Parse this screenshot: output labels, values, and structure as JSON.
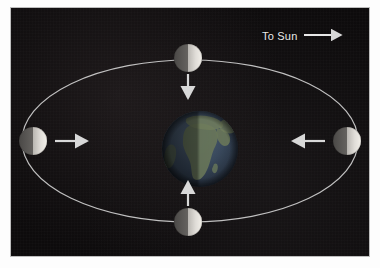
{
  "figure": {
    "background_color": "#0d0b0c",
    "matte_color": "#fdfdfd",
    "border_color": "#bdbdbd"
  },
  "annotations": {
    "to_sun_label": "To Sun",
    "to_sun_arrow": "arrow-right-icon"
  },
  "earth": {
    "name": "Earth",
    "center": {
      "x": 189,
      "y": 141
    },
    "radius": 38,
    "lit_side": "right",
    "ocean_color": "#3a4a5e",
    "land_color": "#5d6b55",
    "shadow_color": "#1b1f26"
  },
  "orbit": {
    "label": "Moon orbit",
    "center": {
      "x": 179,
      "y": 133
    },
    "radius_x": 168,
    "radius_y": 81,
    "stroke_color": "#cfcfcf",
    "stroke_width": 1.2
  },
  "moons": [
    {
      "id": "moon-top",
      "position_label": "first-quarter",
      "center": {
        "x": 177,
        "y": 50
      },
      "radius": 14,
      "lit_side": "right",
      "arrow": {
        "name": "tidal-force-arrow-down",
        "direction": "down",
        "from": {
          "x": 177,
          "y": 64
        },
        "to": {
          "x": 177,
          "y": 94
        }
      }
    },
    {
      "id": "moon-left",
      "position_label": "full-moon",
      "center": {
        "x": 22,
        "y": 133
      },
      "radius": 14,
      "lit_side": "right",
      "arrow": {
        "name": "tidal-force-arrow-right",
        "direction": "right",
        "from": {
          "x": 44,
          "y": 133
        },
        "to": {
          "x": 80,
          "y": 133
        }
      }
    },
    {
      "id": "moon-right",
      "position_label": "new-moon",
      "center": {
        "x": 336,
        "y": 133
      },
      "radius": 14,
      "lit_side": "right",
      "arrow": {
        "name": "tidal-force-arrow-left",
        "direction": "left",
        "from": {
          "x": 314,
          "y": 133
        },
        "to": {
          "x": 278,
          "y": 133
        }
      }
    },
    {
      "id": "moon-bottom",
      "position_label": "third-quarter",
      "center": {
        "x": 177,
        "y": 214
      },
      "radius": 14,
      "lit_side": "right",
      "arrow": {
        "name": "tidal-force-arrow-up",
        "direction": "up",
        "from": {
          "x": 177,
          "y": 200
        },
        "to": {
          "x": 177,
          "y": 170
        }
      }
    }
  ],
  "colors": {
    "moon_lit": "#e6e4e0",
    "moon_dark": "#6f6c69",
    "arrow": "#d8d8d8",
    "text": "#e9e9e9"
  }
}
